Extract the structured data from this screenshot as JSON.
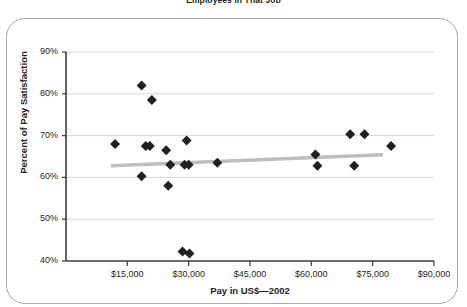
{
  "figure": {
    "clipped_caption": "Employees in That Job",
    "border_color": "#a7a9ac",
    "background": "#ffffff"
  },
  "chart_data": {
    "type": "scatter",
    "title": "",
    "xlabel": "Pay in US$—2002",
    "ylabel": "Percent of Pay Satisfaction",
    "xlim": [
      0,
      90000
    ],
    "ylim": [
      40,
      90
    ],
    "xticks": [
      15000,
      30000,
      45000,
      60000,
      75000,
      90000
    ],
    "xtick_labels": [
      "$15,000",
      "$30,000",
      "$45,000",
      "$60,000",
      "$75,000",
      "$90,000"
    ],
    "yticks": [
      40,
      50,
      60,
      70,
      80,
      90
    ],
    "ytick_labels": [
      "40%",
      "50%",
      "60%",
      "70%",
      "80%",
      "90%"
    ],
    "grid": "horizontal",
    "legend": "none",
    "marker": {
      "shape": "diamond",
      "color": "#231f20",
      "size": 5
    },
    "points": [
      {
        "x": 12000,
        "y": 68.0
      },
      {
        "x": 18500,
        "y": 82.0
      },
      {
        "x": 21000,
        "y": 78.5
      },
      {
        "x": 19500,
        "y": 67.5
      },
      {
        "x": 20500,
        "y": 67.5
      },
      {
        "x": 18500,
        "y": 60.3
      },
      {
        "x": 24500,
        "y": 66.5
      },
      {
        "x": 25500,
        "y": 63.0
      },
      {
        "x": 25000,
        "y": 58.0
      },
      {
        "x": 28500,
        "y": 42.3
      },
      {
        "x": 30200,
        "y": 41.8
      },
      {
        "x": 29000,
        "y": 63.0
      },
      {
        "x": 30000,
        "y": 63.0
      },
      {
        "x": 29500,
        "y": 68.8
      },
      {
        "x": 37000,
        "y": 63.5
      },
      {
        "x": 61000,
        "y": 65.5
      },
      {
        "x": 61500,
        "y": 62.8
      },
      {
        "x": 69500,
        "y": 70.3
      },
      {
        "x": 73000,
        "y": 70.3
      },
      {
        "x": 70500,
        "y": 62.8
      },
      {
        "x": 79500,
        "y": 67.5
      }
    ],
    "trendline": {
      "color": "#bcbec0",
      "width": 3.5,
      "x_start": 11000,
      "y_start": 62.8,
      "x_end": 77500,
      "y_end": 65.4
    }
  }
}
